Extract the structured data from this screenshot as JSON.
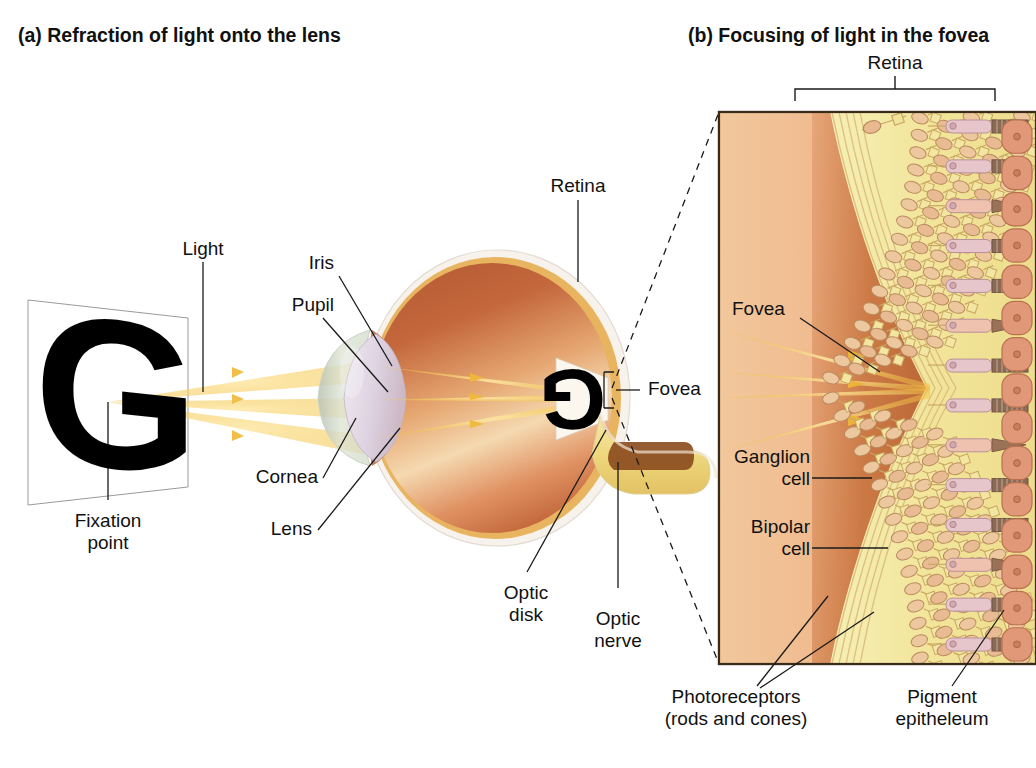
{
  "figure": {
    "ghost_caption": "Copyright notice",
    "panels": [
      {
        "id": "a",
        "title": "(a) Refraction of light onto the lens"
      },
      {
        "id": "b",
        "title": "(b) Focusing of light in the fovea"
      }
    ]
  },
  "panel_a": {
    "labels": {
      "light": "Light",
      "iris": "Iris",
      "pupil": "Pupil",
      "cornea": "Cornea",
      "lens": "Lens",
      "retina": "Retina",
      "fovea": "Fovea",
      "optic_disk": "Optic\ndisk",
      "optic_nerve": "Optic\nnerve",
      "fixation_point": "Fixation\npoint",
      "stimulus_letter": "G"
    },
    "colors": {
      "sclera": "#f3ece6",
      "globe_upper": "#c0653d",
      "globe_lower": "#f0c89a",
      "choroid": "#e8b45f",
      "cornea": "#cfd6c6",
      "lens": "#ddd4e0",
      "light_ray": "#f5c64a",
      "optic_nerve": "#f0d88a",
      "optic_nerve_core": "#8a4a1e"
    }
  },
  "panel_b": {
    "labels": {
      "retina_bracket": "Retina",
      "fovea": "Fovea",
      "ganglion_cell": "Ganglion\ncell",
      "bipolar_cell": "Bipolar\ncell",
      "photoreceptors": "Photoreceptors\n(rods and cones)",
      "pigment_epithelium": "Pigment\nepitheleum"
    },
    "colors": {
      "vitreous": "#f0b98a",
      "fovea_pit": "#c9743f",
      "cell_layer": "#f2e7a0",
      "nerve_fiber": "#e8d98a",
      "photoreceptor_body": "#e5c0c4",
      "photoreceptor_outer": "#8a6a55",
      "pigment_epithelium": "#e09878",
      "light_ray": "#f5c64a",
      "border": "#3a2a1a"
    },
    "structure": {
      "diagonal_cell_rows": 16,
      "photoreceptor_rows": 14,
      "pigment_cells": 15
    }
  }
}
